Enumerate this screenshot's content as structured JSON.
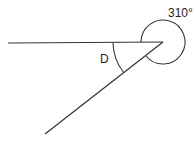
{
  "diagram": {
    "labels": {
      "reflex_angle": "310°",
      "inner_angle": "D"
    },
    "line_color": "#333333"
  }
}
